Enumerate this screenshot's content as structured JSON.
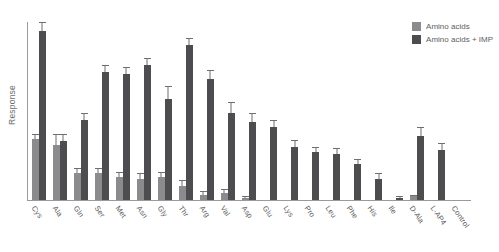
{
  "chart_data": {
    "type": "bar",
    "title": "",
    "xlabel": "",
    "ylabel": "Response",
    "ylim": [
      0,
      100
    ],
    "grid": false,
    "legend_position": "top-right",
    "categories": [
      "Cys",
      "Ala",
      "Gln",
      "Ser",
      "Met",
      "Asn",
      "Gly",
      "Thr",
      "Arg",
      "Val",
      "Asp",
      "Glu",
      "Lys",
      "Pro",
      "Leu",
      "Phe",
      "His",
      "Ile",
      "D-Ala",
      "L-AP4",
      "Control"
    ],
    "series": [
      {
        "name": "Amino acids",
        "color": "#8b8b8d",
        "values": [
          34,
          31,
          15,
          15,
          13,
          12,
          13,
          8,
          3,
          4,
          1,
          0,
          0,
          0,
          0,
          0,
          0,
          0,
          2,
          0,
          0
        ],
        "errors": [
          3,
          6,
          3,
          3,
          3,
          3,
          3,
          3,
          2,
          2,
          1,
          0,
          0,
          0,
          0,
          0,
          0,
          0,
          1,
          0,
          0
        ]
      },
      {
        "name": "Amino acids + IMP",
        "color": "#4d4d4f",
        "values": [
          95,
          33,
          45,
          72,
          71,
          76,
          57,
          87,
          68,
          49,
          44,
          41,
          30,
          27,
          26,
          20,
          12,
          1,
          36,
          28,
          0
        ],
        "errors": [
          5,
          4,
          4,
          4,
          4,
          4,
          7,
          4,
          5,
          6,
          5,
          4,
          4,
          3,
          3,
          3,
          3,
          1,
          5,
          4,
          0
        ]
      }
    ],
    "legend": [
      {
        "label": "Amino acids",
        "swatch": "light"
      },
      {
        "label": "Amino acids + IMP",
        "swatch": "dark"
      }
    ]
  }
}
